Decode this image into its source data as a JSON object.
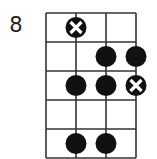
{
  "diagram": {
    "type": "fretboard",
    "start_fret_label": "8",
    "strings": 4,
    "frets": 5,
    "grid": {
      "left": 46,
      "top": 13,
      "string_spacing": 30,
      "fret_spacing": 29
    },
    "colors": {
      "line": "#333333",
      "dot": "#111111",
      "background": "#ffffff"
    },
    "markers": [
      {
        "fret": 1,
        "string": 2,
        "kind": "root-x"
      },
      {
        "fret": 2,
        "string": 3,
        "kind": "dot"
      },
      {
        "fret": 2,
        "string": 4,
        "kind": "dot"
      },
      {
        "fret": 3,
        "string": 2,
        "kind": "dot"
      },
      {
        "fret": 3,
        "string": 3,
        "kind": "dot"
      },
      {
        "fret": 3,
        "string": 4,
        "kind": "root-x"
      },
      {
        "fret": 5,
        "string": 2,
        "kind": "dot"
      },
      {
        "fret": 5,
        "string": 3,
        "kind": "dot"
      }
    ]
  }
}
